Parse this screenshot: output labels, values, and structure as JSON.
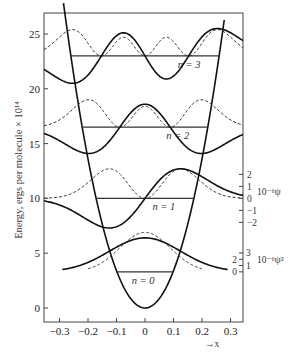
{
  "chart_data": {
    "type": "line",
    "title": "",
    "xlabel": "→x",
    "ylabel": "Energy, ergs per molecule × 10¹⁴",
    "xlim": [
      -0.353,
      0.344
    ],
    "ylim": [
      -1.3,
      25.8
    ],
    "x_ticks": [
      -0.3,
      -0.2,
      -0.1,
      0,
      0.1,
      0.2,
      0.3
    ],
    "x_tick_labels": [
      "−0.3",
      "−0.2",
      "−0.1",
      "0",
      "0.1",
      "0.2",
      "0.3"
    ],
    "y_ticks": [
      0,
      5,
      10,
      15,
      20,
      25
    ],
    "y_tick_labels": [
      "0",
      "5",
      "10",
      "15",
      "20",
      "25"
    ],
    "grid": false,
    "potential": {
      "name": "V(x) = ½ k x²",
      "k": 680,
      "x_range": [
        -0.286,
        0.278
      ]
    },
    "levels": [
      {
        "n": 0,
        "energy": 3.3,
        "label": "n = 0",
        "psi_amp": 3.1,
        "psi2_amp": 3.6,
        "alpha": 64
      },
      {
        "n": 1,
        "energy": 10.0,
        "label": "n = 1",
        "psi_amp": 2.7,
        "psi2_amp": 2.7,
        "alpha": 64
      },
      {
        "n": 2,
        "energy": 16.5,
        "label": "n = 2",
        "psi_amp": 2.4,
        "psi2_amp": 2.5,
        "alpha": 64
      },
      {
        "n": 3,
        "energy": 23.0,
        "label": "n = 3",
        "psi_amp": 2.5,
        "psi2_amp": 2.4,
        "alpha": 64
      }
    ],
    "series": [
      {
        "name": "psi (wavefunction)",
        "style": "solid"
      },
      {
        "name": "psi squared (probability density)",
        "style": "dashed"
      },
      {
        "name": "potential energy",
        "style": "solid"
      }
    ],
    "right_axis_psi": {
      "label": "10⁻⁶ψ",
      "baseline_level": 1,
      "ticks": [
        2,
        1,
        0,
        -1,
        -2
      ],
      "tick_labels": [
        "2",
        "1",
        "0",
        "−1",
        "−2"
      ]
    },
    "right_axis_psi2": {
      "label": "10⁻⁶ψ²",
      "baseline_level": 0,
      "ticks": [
        3,
        2,
        1,
        0
      ],
      "tick_labels": [
        "3",
        "2",
        "1",
        "0"
      ]
    }
  }
}
